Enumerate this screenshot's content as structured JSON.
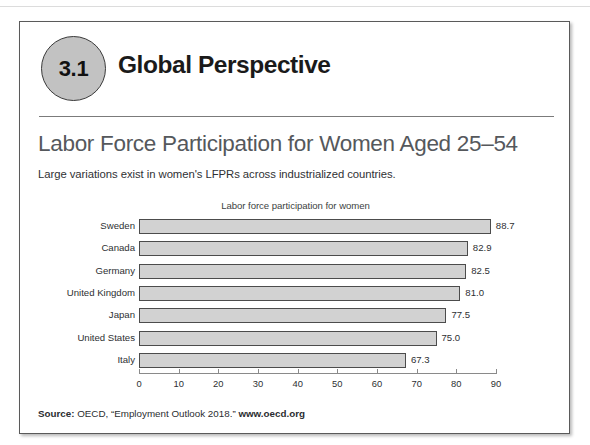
{
  "header": {
    "badge_number": "3.1",
    "title": "Global Perspective"
  },
  "exhibit": {
    "title": "Labor Force Participation for Women Aged 25–54",
    "subtitle": "Large variations exist in women's LFPRs across industrialized countries."
  },
  "source": {
    "prefix_label": "Source:",
    "citation": " OECD, “Employment Outlook 2018.” ",
    "url": "www.oecd.org"
  },
  "colors": {
    "bar_fill": "#d2d2d2",
    "bar_stroke": "#4c4c4c",
    "badge_fill": "#c2c2c2",
    "title_text": "#55585c",
    "box_border": "#5a5a5a"
  },
  "chart_data": {
    "type": "bar",
    "orientation": "horizontal",
    "title": "Labor force participation for women",
    "xlabel": "",
    "ylabel": "",
    "xlim": [
      0,
      90
    ],
    "xticks": [
      0,
      10,
      20,
      30,
      40,
      50,
      60,
      70,
      80,
      90
    ],
    "xtick_labels": [
      "0",
      "10",
      "20",
      "30",
      "40",
      "50",
      "60",
      "70",
      "80",
      "90"
    ],
    "grid": false,
    "legend": false,
    "categories": [
      "Sweden",
      "Canada",
      "Germany",
      "United Kingdom",
      "Japan",
      "United States",
      "Italy"
    ],
    "values": [
      88.7,
      82.9,
      82.5,
      81.0,
      77.5,
      75.0,
      67.3
    ],
    "value_labels": [
      "88.7",
      "82.9",
      "82.5",
      "81.0",
      "77.5",
      "75.0",
      "67.3"
    ]
  }
}
